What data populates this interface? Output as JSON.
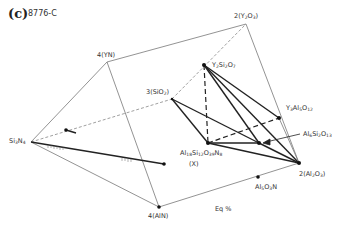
{
  "figure": {
    "panel_letter": "(c)",
    "sample_id": "8776-C",
    "axis_note": "Eq %"
  },
  "vertices": {
    "yn": {
      "label": "4(YN)",
      "x": 107,
      "y": 62
    },
    "y2o3": {
      "label": "2(Y2O3)",
      "x": 246,
      "y": 24
    },
    "si3n4": {
      "label": "Si3N4",
      "x": 31,
      "y": 142
    },
    "aln": {
      "label": "4(AlN)",
      "x": 159,
      "y": 207
    },
    "al2o3": {
      "label": "2(Al2O3)",
      "x": 299,
      "y": 163
    },
    "sio2": {
      "label": "3(SiO2)",
      "x": 172,
      "y": 99
    }
  },
  "phases": {
    "y2si2o7": {
      "label": "Y2Si2O7",
      "x": 204,
      "y": 65
    },
    "y3al5o12": {
      "label": "Y3Al5O12",
      "x": 279,
      "y": 118
    },
    "al6si2o13": {
      "label": "Al6Si2O13",
      "x": 259,
      "y": 143
    },
    "x_phase": {
      "label": "Al18Si12O39N8",
      "sublabel": "(X)",
      "x": 208,
      "y": 143
    },
    "al5o3n": {
      "label": "Al5O3N",
      "x": 258,
      "y": 177
    }
  },
  "labels": {
    "yn": "4(YN)",
    "y2o3_pre": "2(Y",
    "y2o3_s1": "2",
    "y2o3_mid": "O",
    "y2o3_s2": "3",
    "y2o3_post": ")",
    "si3n4_pre": "Si",
    "si3n4_s1": "3",
    "si3n4_mid": "N",
    "si3n4_s2": "4",
    "aln": "4(AlN)",
    "al2o3_pre": "2(Al",
    "al2o3_s1": "2",
    "al2o3_mid": "O",
    "al2o3_s2": "3",
    "al2o3_post": ")",
    "sio2_pre": "3(SiO",
    "sio2_s1": "2",
    "sio2_post": ")",
    "y2si2o7_a": "Y",
    "y2si2o7_s1": "2",
    "y2si2o7_b": "Si",
    "y2si2o7_s2": "2",
    "y2si2o7_c": "O",
    "y2si2o7_s3": "7",
    "y3al5o12_a": "Y",
    "y3al5o12_s1": "3",
    "y3al5o12_b": "Al",
    "y3al5o12_s2": "5",
    "y3al5o12_c": "O",
    "y3al5o12_s3": "12",
    "al6si2o13_a": "Al",
    "al6si2o13_s1": "6",
    "al6si2o13_b": "Si",
    "al6si2o13_s2": "2",
    "al6si2o13_c": "O",
    "al6si2o13_s3": "13",
    "x_a": "Al",
    "x_s1": "18",
    "x_b": "Si",
    "x_s2": "12",
    "x_c": "O",
    "x_s3": "39",
    "x_d": "N",
    "x_s4": "8",
    "x_tag": "(X)",
    "al5o3n_a": "Al",
    "al5o3n_s1": "5",
    "al5o3n_b": "O",
    "al5o3n_s2": "3",
    "al5o3n_c": "N"
  },
  "colors": {
    "frame": "#777777",
    "tie_line": "#222222",
    "text": "#333333"
  }
}
